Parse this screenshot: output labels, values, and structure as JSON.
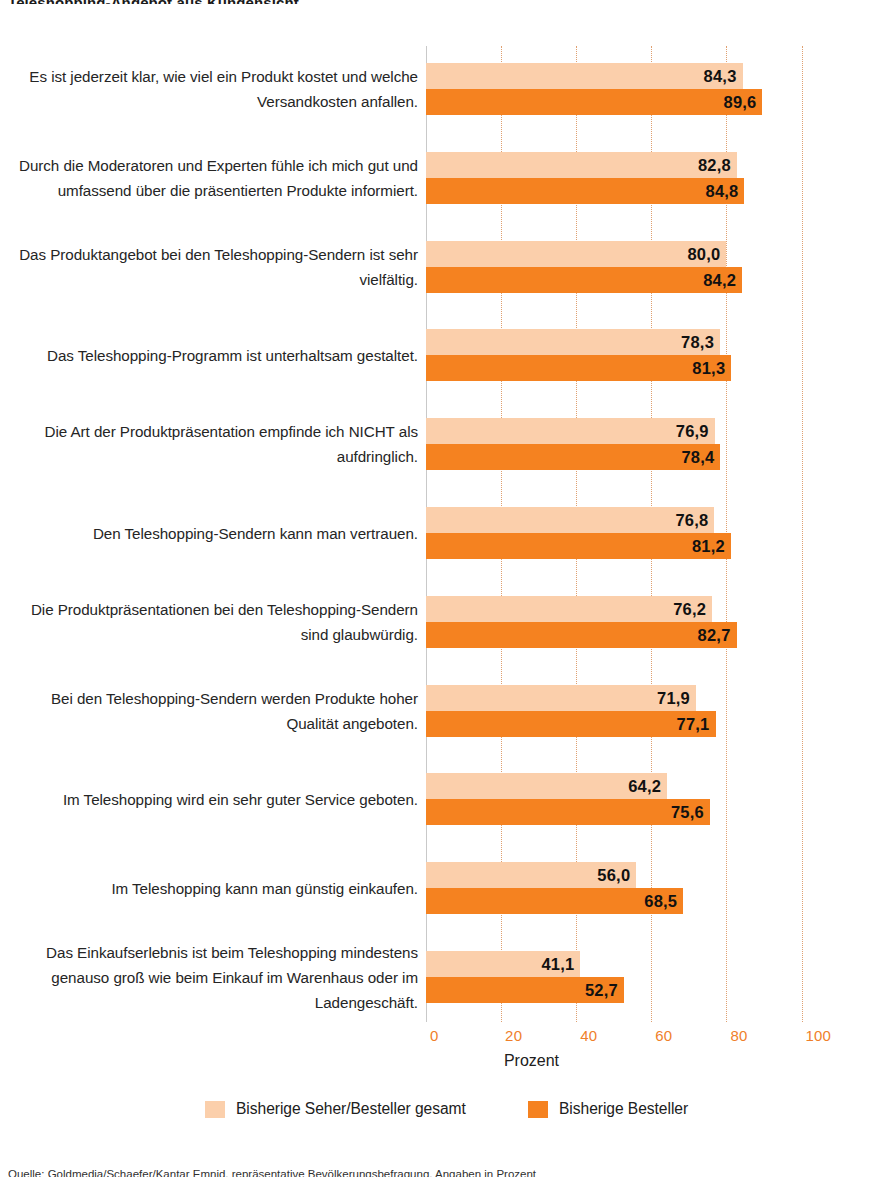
{
  "figure": {
    "top_fragment": "Teleshopping-Angebot aus Kundensicht",
    "footnote": "Quelle: Goldmedia/Schaefer/Kantar Emnid, repräsentative Bevölkerungsbefragung, Angaben in Prozent"
  },
  "axis": {
    "x_title": "Prozent",
    "ticks": [
      "0",
      "20",
      "40",
      "60",
      "80",
      "100"
    ]
  },
  "legend": {
    "items": [
      {
        "label": "Bisherige Seher/Besteller gesamt",
        "color": "#FBCFAB"
      },
      {
        "label": "Bisherige Besteller",
        "color": "#F58220"
      }
    ]
  },
  "colors": {
    "light_orange": "#FBCFAB",
    "dark_orange": "#F58220",
    "tick_text": "#EF7F2A",
    "gridline": "#E0A070",
    "axis_line": "#C9C9C9",
    "value_text": "#111111"
  },
  "chart_data": {
    "type": "bar",
    "orientation": "horizontal",
    "title": "",
    "xlabel": "Prozent",
    "ylabel": "",
    "xlim": [
      0,
      100
    ],
    "grid": true,
    "legend_position": "bottom",
    "categories": [
      "Es ist jederzeit klar, wie viel ein Produkt kostet und welche Versandkosten anfallen.",
      "Durch die Moderatoren und Experten fühle ich mich gut und umfassend über die präsentierten Produkte informiert.",
      "Das Produktangebot bei den Teleshopping-Sendern ist sehr vielfältig.",
      "Das Teleshopping-Programm ist unterhaltsam gestaltet.",
      "Die Art der Produktpräsentation empfinde ich NICHT als aufdringlich.",
      "Den Teleshopping-Sendern kann man vertrauen.",
      "Die Produktpräsentationen bei den Teleshopping-Sendern sind glaubwürdig.",
      "Bei den Teleshopping-Sendern werden Produkte hoher Qualität angeboten.",
      "Im Teleshopping wird ein sehr guter Service geboten.",
      "Im Teleshopping kann man günstig einkaufen.",
      "Das Einkaufserlebnis ist beim Teleshopping mindestens genauso groß wie beim Einkauf im Warenhaus oder im Ladengeschäft."
    ],
    "series": [
      {
        "name": "Bisherige Seher/Besteller gesamt",
        "color": "#FBCFAB",
        "values": [
          84.3,
          82.8,
          80.0,
          78.3,
          76.9,
          76.8,
          76.2,
          71.9,
          64.2,
          56.0,
          41.1
        ],
        "labels": [
          "84,3",
          "82,8",
          "80,0",
          "78,3",
          "76,9",
          "76,8",
          "76,2",
          "71,9",
          "64,2",
          "56,0",
          "41,1"
        ]
      },
      {
        "name": "Bisherige Besteller",
        "color": "#F58220",
        "values": [
          89.6,
          84.8,
          84.2,
          81.3,
          78.4,
          81.2,
          82.7,
          77.1,
          75.6,
          68.5,
          52.7
        ],
        "labels": [
          "89,6",
          "84,8",
          "84,2",
          "81,3",
          "78,4",
          "81,2",
          "82,7",
          "77,1",
          "75,6",
          "68,5",
          "52,7"
        ]
      }
    ]
  }
}
